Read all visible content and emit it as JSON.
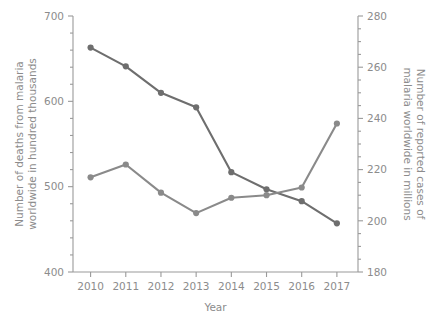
{
  "chart_data": {
    "type": "line",
    "title": "",
    "xlabel": "Year",
    "categories": [
      2010,
      2011,
      2012,
      2013,
      2014,
      2015,
      2016,
      2017
    ],
    "x_tick_labels": [
      "2010",
      "2011",
      "2012",
      "2013",
      "2014",
      "2015",
      "2016",
      "2017"
    ],
    "grid": false,
    "legend": "none",
    "series": [
      {
        "name": "Number of deaths from malaria worldwide in hundred thousands",
        "axis": "left",
        "color": "#6e6e6e",
        "values": [
          663,
          641,
          610,
          593,
          517,
          497,
          483,
          457
        ]
      },
      {
        "name": "Number of reported cases of malaria worldwide in millions",
        "axis": "right",
        "color": "#8a8a8a",
        "values": [
          217,
          222,
          211,
          203,
          209,
          210,
          213,
          238
        ]
      }
    ],
    "left_axis": {
      "label": "Number of deaths from malaria worldwide in hundred thousands",
      "ylim": [
        400,
        700
      ],
      "ticks": [
        400,
        500,
        600,
        700
      ],
      "tick_labels": [
        "400",
        "500",
        "600",
        "700"
      ],
      "minor_tick_step": 20
    },
    "right_axis": {
      "label": "Number of reported cases of malaria worldwide in millions",
      "ylim": [
        180,
        280
      ],
      "ticks": [
        180,
        200,
        220,
        240,
        260,
        280
      ],
      "tick_labels": [
        "180",
        "200",
        "220",
        "240",
        "260",
        "280"
      ],
      "minor_tick_step": 5
    },
    "x_axis": {
      "label": "Year",
      "xlim": [
        2009.5,
        2017.6
      ]
    }
  }
}
